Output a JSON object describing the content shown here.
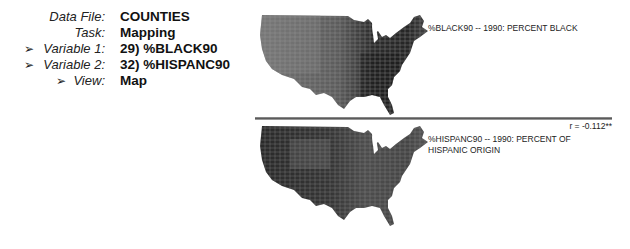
{
  "info": {
    "rows": [
      {
        "label": "Data File:",
        "value": "COUNTIES",
        "arrow": false
      },
      {
        "label": "Task:",
        "value": "Mapping",
        "arrow": false
      },
      {
        "label": "Variable 1:",
        "value": "29) %BLACK90",
        "arrow": true
      },
      {
        "label": "Variable 2:",
        "value": "32) %HISPANC90",
        "arrow": true
      },
      {
        "label": "View:",
        "value": "Map",
        "arrow": true
      }
    ],
    "arrow_glyph": "➢"
  },
  "maps": [
    {
      "name": "map-black90",
      "caption": "%BLACK90 -- 1990: PERCENT BLACK",
      "shading": {
        "west": "#6d6d6d",
        "midwest": "#5a5a5a",
        "south": "#262626",
        "northeast": "#4a4a4a"
      }
    },
    {
      "name": "map-hispanc90",
      "caption_line1": "%HISPANC90 -- 1990: PERCENT OF",
      "caption_line2": "HISPANIC ORIGIN",
      "shading": {
        "west": "#2c2c2c",
        "midwest": "#505050",
        "south": "#3a3a3a",
        "northeast": "#555555"
      }
    }
  ],
  "correlation": "r = -0.112**"
}
